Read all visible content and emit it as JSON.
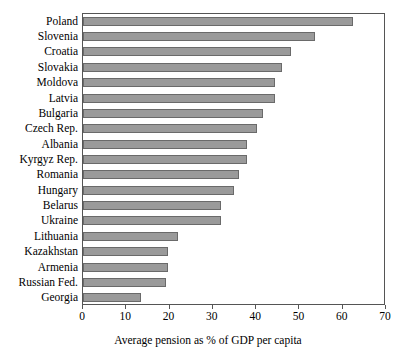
{
  "chart_data": {
    "type": "bar",
    "orientation": "horizontal",
    "title": "",
    "xlabel": "Average pension as % of GDP per capita",
    "ylabel": "",
    "xlim": [
      0,
      70
    ],
    "xticks": [
      0,
      10,
      20,
      30,
      40,
      50,
      60,
      70
    ],
    "grid": false,
    "legend": null,
    "bar_color": "#9a9a9a",
    "bar_border_color": "#6a6a6a",
    "axis_color": "#555555",
    "categories": [
      "Poland",
      "Slovenia",
      "Croatia",
      "Slovakia",
      "Moldova",
      "Latvia",
      "Bulgaria",
      "Czech Rep.",
      "Albania",
      "Kyrgyz Rep.",
      "Romania",
      "Hungary",
      "Belarus",
      "Ukraine",
      "Lithuania",
      "Kazakhstan",
      "Armenia",
      "Russian Fed.",
      "Georgia"
    ],
    "values": [
      62.3,
      53.6,
      48.0,
      46.0,
      44.3,
      44.3,
      41.6,
      40.2,
      37.9,
      37.9,
      36.0,
      34.9,
      31.9,
      31.9,
      22.0,
      19.6,
      19.6,
      19.2,
      13.4
    ]
  }
}
